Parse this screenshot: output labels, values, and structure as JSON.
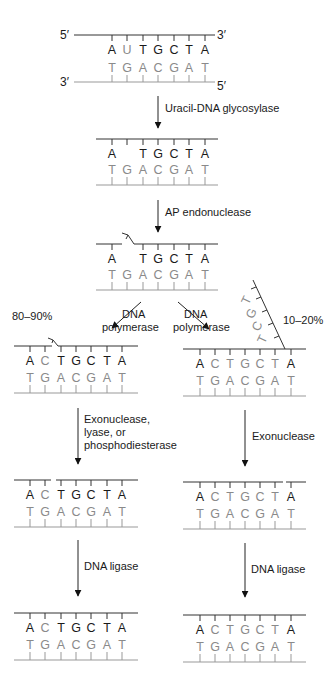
{
  "diagram": {
    "ends": {
      "five_prime": "5′",
      "three_prime": "3′"
    },
    "initial": {
      "top_strand": [
        "A",
        "U",
        "T",
        "G",
        "C",
        "T",
        "A"
      ],
      "bottom_strand": [
        "T",
        "G",
        "A",
        "C",
        "G",
        "A",
        "T"
      ]
    },
    "steps": [
      {
        "enzyme": "Uracil-DNA glycosylase",
        "top_strand": [
          "A",
          "",
          "T",
          "G",
          "C",
          "T",
          "A"
        ],
        "bottom_strand": [
          "T",
          "G",
          "A",
          "C",
          "G",
          "A",
          "T"
        ]
      },
      {
        "enzyme": "AP endonuclease",
        "top_strand": [
          "A",
          "",
          "T",
          "G",
          "C",
          "T",
          "A"
        ],
        "bottom_strand": [
          "T",
          "G",
          "A",
          "C",
          "G",
          "A",
          "T"
        ]
      }
    ],
    "branches": {
      "left": {
        "percentage": "80–90%",
        "step1_enzyme_line1": "DNA",
        "step1_enzyme_line2": "polymerase",
        "after_polymerase": {
          "top_strand": [
            "A",
            "C",
            "T",
            "G",
            "C",
            "T",
            "A"
          ],
          "bottom_strand": [
            "T",
            "G",
            "A",
            "C",
            "G",
            "A",
            "T"
          ]
        },
        "step2_enzyme_line1": "Exonuclease,",
        "step2_enzyme_line2": "lyase, or",
        "step2_enzyme_line3": "phosphodiesterase",
        "after_excision": {
          "top_strand": [
            "A",
            "C",
            "T",
            "G",
            "C",
            "T",
            "A"
          ],
          "bottom_strand": [
            "T",
            "G",
            "A",
            "C",
            "G",
            "A",
            "T"
          ]
        },
        "step3_enzyme": "DNA ligase",
        "final": {
          "top_strand": [
            "A",
            "C",
            "T",
            "G",
            "C",
            "T",
            "A"
          ],
          "bottom_strand": [
            "T",
            "G",
            "A",
            "C",
            "G",
            "A",
            "T"
          ]
        }
      },
      "right": {
        "percentage": "10–20%",
        "step1_enzyme_line1": "DNA",
        "step1_enzyme_line2": "polymerase",
        "displaced_flap": [
          "T",
          "G",
          "C",
          "T"
        ],
        "after_polymerase": {
          "top_strand": [
            "A",
            "C",
            "T",
            "G",
            "C",
            "T",
            "A"
          ],
          "bottom_strand": [
            "T",
            "G",
            "A",
            "C",
            "G",
            "A",
            "T"
          ]
        },
        "step2_enzyme": "Exonuclease",
        "after_excision": {
          "top_strand": [
            "A",
            "C",
            "T",
            "G",
            "C",
            "T",
            "A"
          ],
          "bottom_strand": [
            "T",
            "G",
            "A",
            "C",
            "G",
            "A",
            "T"
          ]
        },
        "step3_enzyme": "DNA ligase",
        "final": {
          "top_strand": [
            "A",
            "C",
            "T",
            "G",
            "C",
            "T",
            "A"
          ],
          "bottom_strand": [
            "T",
            "G",
            "A",
            "C",
            "G",
            "A",
            "T"
          ]
        }
      }
    },
    "colors": {
      "ink": "#1a1a1a",
      "complement": "#8a8a8a",
      "background": "#ffffff"
    }
  }
}
